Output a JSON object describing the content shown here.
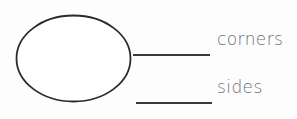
{
  "worksheet": {
    "title": "Shape attributes fill-in-the-blank",
    "background_color": "#fdfdfd",
    "shape": {
      "name": "oval",
      "icon": "ellipse-outline-icon",
      "stroke_color": "#2b2b2b",
      "fill_color": "#ffffff",
      "stroke_width": 1.8,
      "center_x": 73.5,
      "center_y": 58.5,
      "radius_x": 57,
      "radius_y": 43
    },
    "rows": [
      {
        "id": "corners",
        "label": "corners",
        "answer_value": "",
        "blank_placeholder": "",
        "line_color": "#3a3a3a"
      },
      {
        "id": "sides",
        "label": "sides",
        "answer_value": "",
        "blank_placeholder": "",
        "line_color": "#3a3a3a"
      }
    ],
    "text_color": "#6e6e6e"
  }
}
